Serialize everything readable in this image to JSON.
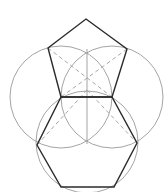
{
  "diagram": {
    "colors": {
      "background": "#ffffff",
      "shape_stroke": "#2b2b2b",
      "construction_stroke": "#9a9a9a",
      "dashed_stroke": "#a8a8a8"
    },
    "pentagon": {
      "points": [
        [
          86,
          19
        ],
        [
          127,
          49
        ],
        [
          112,
          97
        ],
        [
          61,
          97
        ],
        [
          48,
          48
        ]
      ]
    },
    "hexagon": {
      "points": [
        [
          61,
          97
        ],
        [
          112,
          97
        ],
        [
          137,
          143
        ],
        [
          114,
          187
        ],
        [
          61,
          187
        ],
        [
          37,
          145
        ]
      ]
    },
    "circles": [
      {
        "name": "left-construction-circle",
        "cx": 61,
        "cy": 97,
        "r": 51
      },
      {
        "name": "right-construction-circle",
        "cx": 112,
        "cy": 97,
        "r": 51
      },
      {
        "name": "hexagon-circumcircle",
        "cx": 87,
        "cy": 142,
        "r": 51
      }
    ],
    "vertical_axis": {
      "x1": 87,
      "y1": 49,
      "x2": 87,
      "y2": 144
    },
    "dashed_lines": [
      {
        "x1": 48,
        "y1": 48,
        "x2": 112,
        "y2": 97
      },
      {
        "x1": 127,
        "y1": 49,
        "x2": 61,
        "y2": 97
      },
      {
        "x1": 87,
        "y1": 90,
        "x2": 37,
        "y2": 145
      },
      {
        "x1": 87,
        "y1": 90,
        "x2": 137,
        "y2": 143
      }
    ]
  }
}
